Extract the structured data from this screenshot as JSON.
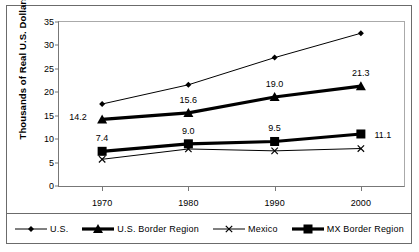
{
  "chart_data": {
    "type": "line",
    "title": "",
    "subtitle": "",
    "xlabel": "",
    "ylabel": "Thousands of Real U.S. Dollars",
    "categories": [
      "1970",
      "1980",
      "1990",
      "2000"
    ],
    "x": [
      1970,
      1980,
      1990,
      2000
    ],
    "xlim": [
      1965,
      2005
    ],
    "ylim": [
      0,
      35
    ],
    "yticks": [
      "0",
      "5",
      "10",
      "15",
      "20",
      "25",
      "30",
      "35"
    ],
    "grid": false,
    "legend_position": "bottom",
    "series": [
      {
        "name": "U.S.",
        "marker": "diamond",
        "line_weight": "thin",
        "color": "#000000",
        "values": [
          17.5,
          21.6,
          27.4,
          32.6
        ],
        "labels": [
          "",
          "",
          "",
          ""
        ]
      },
      {
        "name": "U.S. Border Region",
        "marker": "triangle",
        "line_weight": "thick",
        "color": "#000000",
        "values": [
          14.2,
          15.6,
          19.0,
          21.3
        ],
        "labels": [
          "14.2",
          "15.6",
          "19.0",
          "21.3"
        ]
      },
      {
        "name": "Mexico",
        "marker": "x",
        "line_weight": "thin",
        "color": "#000000",
        "values": [
          5.7,
          7.9,
          7.5,
          8.0
        ],
        "labels": [
          "",
          "",
          "",
          ""
        ]
      },
      {
        "name": "MX Border Region",
        "marker": "square",
        "line_weight": "thick",
        "color": "#000000",
        "values": [
          7.4,
          9.0,
          9.5,
          11.1
        ],
        "labels": [
          "7.4",
          "9.0",
          "9.5",
          "11.1"
        ]
      }
    ],
    "annotations": [
      {
        "text": "14.2",
        "x": 1970,
        "y": 14.2,
        "place": "left"
      },
      {
        "text": "15.6",
        "x": 1980,
        "y": 15.6,
        "place": "above"
      },
      {
        "text": "19.0",
        "x": 1990,
        "y": 19.0,
        "place": "above"
      },
      {
        "text": "21.3",
        "x": 2000,
        "y": 21.3,
        "place": "above"
      },
      {
        "text": "7.4",
        "x": 1970,
        "y": 7.4,
        "place": "above"
      },
      {
        "text": "9.0",
        "x": 1980,
        "y": 9.0,
        "place": "above"
      },
      {
        "text": "9.5",
        "x": 1990,
        "y": 9.5,
        "place": "above"
      },
      {
        "text": "11.1",
        "x": 2000,
        "y": 11.1,
        "place": "right"
      }
    ]
  },
  "legend": {
    "items": [
      {
        "label": "U.S.",
        "marker": "diamond-marker-icon"
      },
      {
        "label": "U.S. Border Region",
        "marker": "triangle-marker-icon"
      },
      {
        "label": "Mexico",
        "marker": "x-marker-icon"
      },
      {
        "label": "MX Border Region",
        "marker": "square-marker-icon"
      }
    ]
  }
}
